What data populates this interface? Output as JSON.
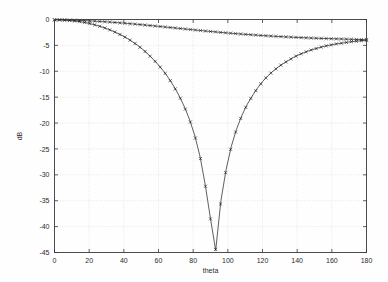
{
  "figure": {
    "background": "#fefefe",
    "axis_color": "#3a3a3a",
    "grid_color": "#cfcfcf",
    "series_color": "#1a1a1a"
  },
  "chart_data": {
    "type": "line",
    "title": "",
    "subtitle": "",
    "xlabel": "theta",
    "ylabel": "dB",
    "xlim": [
      0,
      180
    ],
    "ylim": [
      -45,
      0
    ],
    "xticks": [
      0,
      20,
      40,
      60,
      80,
      100,
      120,
      140,
      160,
      180
    ],
    "xticklabels": [
      "0",
      "20",
      "40",
      "60",
      "80",
      "100",
      "120",
      "140",
      "160",
      "180"
    ],
    "yticks": [
      0,
      -5,
      -10,
      -15,
      -20,
      -25,
      -30,
      -35,
      -40,
      -45
    ],
    "yticklabels": [
      "0",
      "-5",
      "-10",
      "-15",
      "-20",
      "-25",
      "-30",
      "-35",
      "-40",
      "-45"
    ],
    "grid": true,
    "legend": null,
    "legend_position": "none",
    "marker": "x",
    "linestyle": "solid",
    "x": [
      0,
      3,
      6,
      9,
      12,
      15,
      18,
      21,
      24,
      27,
      30,
      33,
      36,
      39,
      42,
      45,
      48,
      51,
      54,
      57,
      60,
      63,
      66,
      69,
      72,
      75,
      78,
      81,
      84,
      87,
      90,
      93,
      96,
      99,
      102,
      105,
      108,
      111,
      114,
      117,
      120,
      123,
      126,
      129,
      132,
      135,
      138,
      141,
      144,
      147,
      150,
      153,
      156,
      159,
      162,
      165,
      168,
      171,
      174,
      177,
      180
    ],
    "series": [
      {
        "name": "upper",
        "values": [
          -0.05,
          -0.06,
          -0.08,
          -0.11,
          -0.14,
          -0.18,
          -0.22,
          -0.27,
          -0.33,
          -0.39,
          -0.45,
          -0.52,
          -0.6,
          -0.68,
          -0.76,
          -0.85,
          -0.94,
          -1.03,
          -1.13,
          -1.22,
          -1.32,
          -1.42,
          -1.52,
          -1.62,
          -1.72,
          -1.82,
          -1.92,
          -2.02,
          -2.12,
          -2.22,
          -2.31,
          -2.4,
          -2.49,
          -2.58,
          -2.66,
          -2.74,
          -2.82,
          -2.89,
          -2.96,
          -3.03,
          -3.1,
          -3.16,
          -3.22,
          -3.28,
          -3.33,
          -3.38,
          -3.43,
          -3.48,
          -3.52,
          -3.56,
          -3.6,
          -3.64,
          -3.67,
          -3.7,
          -3.73,
          -3.76,
          -3.79,
          -3.82,
          -3.85,
          -3.88,
          -3.9
        ]
      },
      {
        "name": "lower",
        "values": [
          -0.05,
          -0.07,
          -0.12,
          -0.2,
          -0.3,
          -0.44,
          -0.62,
          -0.84,
          -1.1,
          -1.4,
          -1.75,
          -2.15,
          -2.6,
          -3.1,
          -3.65,
          -4.3,
          -5.0,
          -5.8,
          -6.7,
          -7.7,
          -8.8,
          -10.0,
          -11.4,
          -13.0,
          -14.8,
          -16.9,
          -19.4,
          -22.5,
          -26.5,
          -32.0,
          -38.5,
          -44.6,
          -35.0,
          -29.0,
          -24.5,
          -21.2,
          -18.6,
          -16.5,
          -14.8,
          -13.3,
          -12.0,
          -10.9,
          -10.0,
          -9.2,
          -8.5,
          -7.9,
          -7.3,
          -6.8,
          -6.4,
          -6.0,
          -5.7,
          -5.4,
          -5.15,
          -4.95,
          -4.75,
          -4.6,
          -4.45,
          -4.3,
          -4.2,
          -4.1,
          -4.0
        ]
      }
    ]
  }
}
